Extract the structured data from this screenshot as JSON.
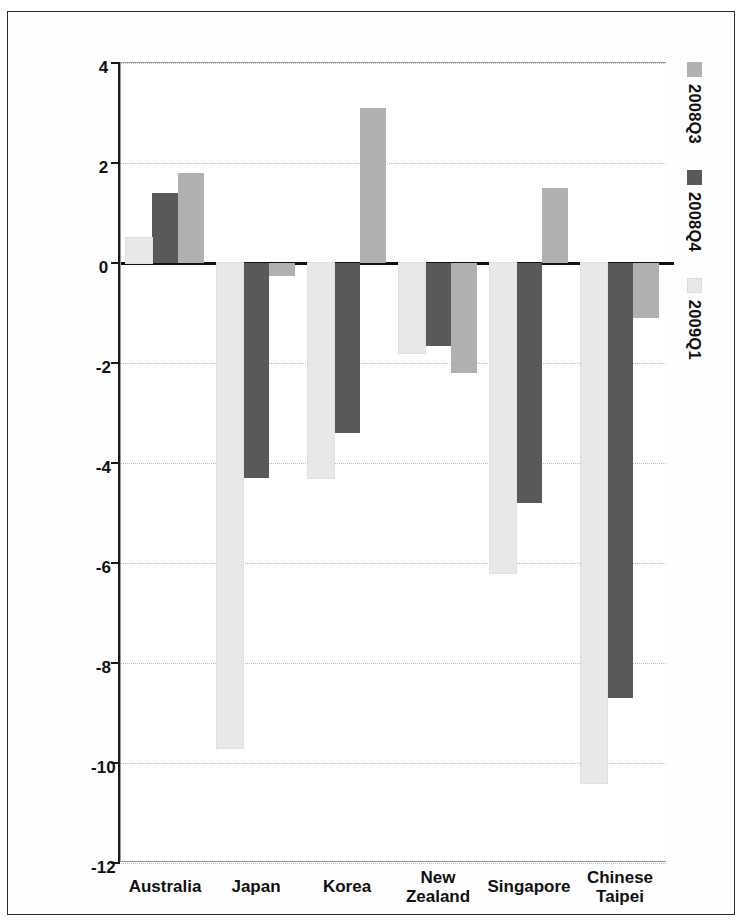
{
  "chart_data": {
    "type": "bar",
    "orientation": "horizontal",
    "title": "",
    "subtitle": "",
    "xlabel": "",
    "ylabel": "",
    "categories": [
      "Australia",
      "Japan",
      "Korea",
      "New Zealand",
      "Singapore",
      "Chinese Taipei"
    ],
    "series": [
      {
        "name": "2008Q3",
        "color": "#b0b0b0",
        "values": [
          1.8,
          -0.25,
          3.1,
          -2.2,
          1.5,
          -1.1
        ]
      },
      {
        "name": "2008Q4",
        "color": "#595959",
        "values": [
          1.4,
          -4.3,
          -3.4,
          -1.65,
          -4.8,
          -8.7
        ]
      },
      {
        "name": "2009Q1",
        "color": "#e8e8e8",
        "values": [
          0.5,
          -9.7,
          -4.3,
          -1.8,
          -6.2,
          -10.4
        ]
      }
    ],
    "xlim": [
      4,
      -12
    ],
    "xticks": [
      4,
      2,
      0,
      -2,
      -4,
      -6,
      -8,
      -10,
      -12
    ],
    "xtick_labels": [
      "4",
      "2",
      "0",
      "-2",
      "-4",
      "-6",
      "-8",
      "-10",
      "-12"
    ],
    "grid": true,
    "grid_axis": "value",
    "legend_position": "top-left",
    "zero_line": true
  },
  "legend": {
    "items": [
      {
        "label": "2008Q3",
        "swatch": "#b0b0b0"
      },
      {
        "label": "2008Q4",
        "swatch": "#595959"
      },
      {
        "label": "2009Q1",
        "swatch": "#e8e8e8"
      }
    ]
  },
  "axis": {
    "value_ticks": [
      "4",
      "2",
      "0",
      "-2",
      "-4",
      "-6",
      "-8",
      "-10",
      "-12"
    ],
    "category_labels": [
      "Australia",
      "Japan",
      "Korea",
      "New Zealand",
      "Singapore",
      "Chinese Taipei"
    ]
  },
  "colors": {
    "series_2008q3": "#b0b0b0",
    "series_2008q4": "#595959",
    "series_2009q1": "#e8e8e8",
    "axis": "#111111",
    "grid": "#c9c9c9",
    "frame": "#2b2b2b",
    "background": "#ffffff"
  }
}
